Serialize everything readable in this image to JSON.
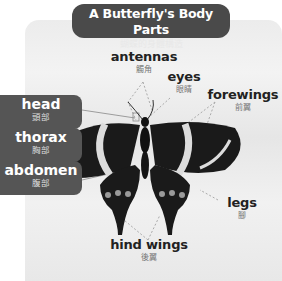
{
  "title": {
    "en": "A Butterfly's Body Parts",
    "zh": "蝴蝶的身體構造"
  },
  "labels": {
    "antennas": {
      "en": "antennas",
      "zh": "觸角"
    },
    "eyes": {
      "en": "eyes",
      "zh": "眼睛"
    },
    "forewings": {
      "en": "forewings",
      "zh": "前翼"
    },
    "legs": {
      "en": "legs",
      "zh": "腳"
    },
    "hind_wings": {
      "en": "hind wings",
      "zh": "後翼"
    }
  },
  "tags": {
    "head": {
      "en": "head",
      "zh": "頭部"
    },
    "thorax": {
      "en": "thorax",
      "zh": "胸部"
    },
    "abdomen": {
      "en": "abdomen",
      "zh": "腹部"
    }
  },
  "colors": {
    "pill": "#4a4a4a",
    "tag": "#555555",
    "wing": "#1a1a1a",
    "band": "#dcdcdc"
  }
}
